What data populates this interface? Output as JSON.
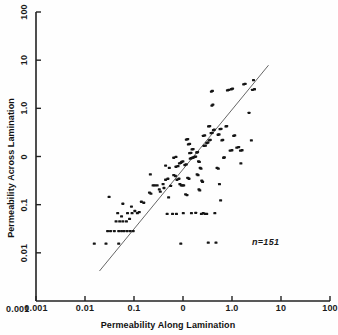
{
  "chart_data": {
    "type": "scatter",
    "title": "",
    "xlabel": "Permeability Along Lamination",
    "ylabel": "Permeability Across Lamination",
    "xscale": "log",
    "yscale": "log",
    "xlim": [
      0.001,
      100
    ],
    "ylim": [
      0.001,
      100
    ],
    "xticks": [
      "0.001",
      "0.01",
      "0.1",
      "0",
      "1.0",
      "10",
      "100"
    ],
    "yticks": [
      "0.001",
      "0.01",
      "0.1",
      "0",
      "1.0",
      "10",
      "100"
    ],
    "grid": false,
    "legend": null,
    "annotations": [
      {
        "name": "sample-size",
        "text": "n=151",
        "x": 20.0,
        "y": 0.016
      }
    ],
    "reference_line": {
      "name": "one-to-one-line",
      "description": "1:1 diagonal reference line",
      "x_start": 0.012,
      "y_start": 0.0033,
      "x_end": 9.0,
      "y_end": 12.0,
      "color": "#555555"
    },
    "marker": {
      "shape": "square",
      "color": "#151515",
      "size_px": 3
    },
    "series": [
      {
        "name": "Core samples",
        "points": [
          [
            0.0098,
            0.0098
          ],
          [
            0.0155,
            0.0098
          ],
          [
            0.0255,
            0.0098
          ],
          [
            0.0165,
            0.0162
          ],
          [
            0.0185,
            0.0162
          ],
          [
            0.0215,
            0.0162
          ],
          [
            0.0255,
            0.0162
          ],
          [
            0.0285,
            0.0162
          ],
          [
            0.0315,
            0.0162
          ],
          [
            0.0355,
            0.0162
          ],
          [
            0.04,
            0.0162
          ],
          [
            0.045,
            0.0162
          ],
          [
            0.023,
            0.0238
          ],
          [
            0.0265,
            0.0238
          ],
          [
            0.03,
            0.0238
          ],
          [
            0.0345,
            0.0238
          ],
          [
            0.039,
            0.0262
          ],
          [
            0.0285,
            0.029
          ],
          [
            0.0245,
            0.033
          ],
          [
            0.036,
            0.033
          ],
          [
            0.043,
            0.033
          ],
          [
            0.048,
            0.036
          ],
          [
            0.053,
            0.033
          ],
          [
            0.057,
            0.0345
          ],
          [
            0.03,
            0.048
          ],
          [
            0.042,
            0.043
          ],
          [
            0.0175,
            0.063
          ],
          [
            0.062,
            0.052
          ],
          [
            0.068,
            0.05
          ],
          [
            0.085,
            0.075
          ],
          [
            0.09,
            0.072
          ],
          [
            0.098,
            0.1
          ],
          [
            0.105,
            0.1
          ],
          [
            0.115,
            0.1
          ],
          [
            0.125,
            0.085
          ],
          [
            0.13,
            0.078
          ],
          [
            0.145,
            0.105
          ],
          [
            0.15,
            0.09
          ],
          [
            0.088,
            0.155
          ],
          [
            0.17,
            0.032
          ],
          [
            0.21,
            0.032
          ],
          [
            0.245,
            0.032
          ],
          [
            0.18,
            0.062
          ],
          [
            0.195,
            0.098
          ],
          [
            0.16,
            0.125
          ],
          [
            0.175,
            0.13
          ],
          [
            0.185,
            0.2
          ],
          [
            0.16,
            0.22
          ],
          [
            0.22,
            0.15
          ],
          [
            0.235,
            0.145
          ],
          [
            0.25,
            0.125
          ],
          [
            0.27,
            0.13
          ],
          [
            0.28,
            0.105
          ],
          [
            0.295,
            0.1
          ],
          [
            0.31,
            0.1
          ],
          [
            0.325,
            0.1
          ],
          [
            0.24,
            0.21
          ],
          [
            0.26,
            0.215
          ],
          [
            0.275,
            0.24
          ],
          [
            0.29,
            0.245
          ],
          [
            0.3,
            0.255
          ],
          [
            0.315,
            0.26
          ],
          [
            0.22,
            0.3
          ],
          [
            0.24,
            0.31
          ],
          [
            0.34,
            0.225
          ],
          [
            0.36,
            0.23
          ],
          [
            0.38,
            0.135
          ],
          [
            0.4,
            0.13
          ],
          [
            0.35,
            0.07
          ],
          [
            0.37,
            0.068
          ],
          [
            0.42,
            0.29
          ],
          [
            0.44,
            0.295
          ],
          [
            0.46,
            0.3
          ],
          [
            0.48,
            0.305
          ],
          [
            0.5,
            0.31
          ],
          [
            0.52,
            0.315
          ],
          [
            0.41,
            0.36
          ],
          [
            0.43,
            0.365
          ],
          [
            0.45,
            0.42
          ],
          [
            0.47,
            0.425
          ],
          [
            0.39,
            0.51
          ],
          [
            0.41,
            0.52
          ],
          [
            0.36,
            0.62
          ],
          [
            0.38,
            0.63
          ],
          [
            0.54,
            0.37
          ],
          [
            0.56,
            0.375
          ],
          [
            0.58,
            0.26
          ],
          [
            0.6,
            0.255
          ],
          [
            0.62,
            0.2
          ],
          [
            0.64,
            0.195
          ],
          [
            0.55,
            0.155
          ],
          [
            0.57,
            0.15
          ],
          [
            0.66,
            0.12
          ],
          [
            0.68,
            0.115
          ],
          [
            0.59,
            0.085
          ],
          [
            0.61,
            0.082
          ],
          [
            0.7,
            0.033
          ],
          [
            0.75,
            0.032
          ],
          [
            0.8,
            0.032
          ],
          [
            0.65,
            0.032
          ],
          [
            0.52,
            0.0335
          ],
          [
            0.44,
            0.033
          ],
          [
            0.32,
            0.033
          ],
          [
            0.85,
            0.0102
          ],
          [
            0.29,
            0.0098
          ],
          [
            0.72,
            0.48
          ],
          [
            0.76,
            0.485
          ],
          [
            0.8,
            0.54
          ],
          [
            0.84,
            0.55
          ],
          [
            0.88,
            0.6
          ],
          [
            0.92,
            0.61
          ],
          [
            0.7,
            0.72
          ],
          [
            0.74,
            0.73
          ],
          [
            0.95,
            0.8
          ],
          [
            0.99,
            0.81
          ],
          [
            1.04,
            0.9
          ],
          [
            1.08,
            0.92
          ],
          [
            0.86,
            1.05
          ],
          [
            0.9,
            1.06
          ],
          [
            0.98,
            2.4
          ],
          [
            1.02,
            2.5
          ],
          [
            0.96,
            4.2
          ],
          [
            1.0,
            4.3
          ],
          [
            1.25,
            0.75
          ],
          [
            1.3,
            0.76
          ],
          [
            1.35,
            0.94
          ],
          [
            1.4,
            0.95
          ],
          [
            1.45,
            0.6
          ],
          [
            1.5,
            0.61
          ],
          [
            1.55,
            0.3
          ],
          [
            1.6,
            0.305
          ],
          [
            1.2,
            0.2
          ],
          [
            1.26,
            0.195
          ],
          [
            1.32,
            0.105
          ],
          [
            1.38,
            0.055
          ],
          [
            1.1,
            0.033
          ],
          [
            1.15,
            0.0102
          ],
          [
            1.7,
            1.05
          ],
          [
            1.75,
            1.06
          ],
          [
            1.8,
            4.4
          ],
          [
            1.9,
            4.5
          ],
          [
            2.1,
            4.6
          ],
          [
            2.2,
            4.7
          ],
          [
            2.0,
            0.4
          ],
          [
            2.15,
            0.405
          ],
          [
            2.3,
            0.72
          ],
          [
            2.4,
            0.73
          ],
          [
            2.6,
            0.45
          ],
          [
            2.8,
            0.46
          ],
          [
            3.0,
            0.4
          ],
          [
            3.2,
            0.405
          ],
          [
            3.4,
            5.6
          ],
          [
            3.6,
            5.7
          ],
          [
            3.05,
            0.24
          ],
          [
            4.2,
            1.8
          ],
          [
            4.6,
            0.6
          ],
          [
            4.8,
            4.5
          ],
          [
            5.2,
            4.6
          ],
          [
            5.0,
            6.6
          ]
        ]
      }
    ]
  },
  "axes": {
    "x_title": "Permeability Along Lamination",
    "y_title": "Permeability Across Lamination",
    "x_tick_labels": [
      "0.001",
      "0.01",
      "0.1",
      "0",
      "1.0",
      "10",
      "100"
    ],
    "y_tick_labels": [
      "0.001",
      "0.01",
      "0.1",
      "0",
      "1.0",
      "10",
      "100"
    ]
  },
  "annotation": {
    "sample_size": "n=151"
  },
  "colors": {
    "axis": "#222222",
    "marker": "#151515",
    "line": "#555555",
    "background": "#fefefe",
    "text": "#111111"
  }
}
